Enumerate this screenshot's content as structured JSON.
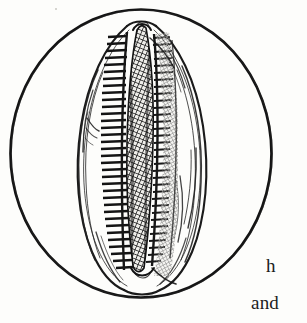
{
  "page": {
    "kind": "book-plate-illustration",
    "background_color": "#fdfdfb",
    "ink_color": "#141414",
    "width": 307,
    "height": 323
  },
  "figure": {
    "name": "cowrie-shell-ventral-view",
    "frame": {
      "shape": "circle",
      "center_x": 141,
      "center_y": 153,
      "radius_x": 131,
      "radius_y": 144,
      "stroke_color": "#141414",
      "stroke_width": 2.6
    },
    "shell": {
      "outline_stroke_color": "#1a1a1a",
      "aperture_fill_color": "#2a2a2a",
      "tooth_count_left": 34,
      "tooth_count_right": 33,
      "hatch_pattern": "crosshatch-diagonal-mesh"
    }
  },
  "text": {
    "line_1": "h",
    "line_2": "and",
    "color": "#1b1b1b",
    "note": "Body text cropped at the right page margin."
  }
}
